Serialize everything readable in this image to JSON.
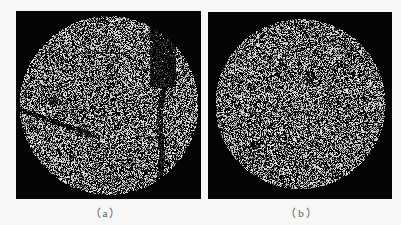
{
  "figure": {
    "background": "#f7f7f7",
    "panels": [
      {
        "id": "a",
        "caption": "（a）",
        "description": "Circular speckle/grain image on black background with dark cracks and voids on right and lower-left",
        "colors": {
          "background": "#050505",
          "speckle": "#d8d8d8"
        },
        "disc": {
          "cx": 0.5,
          "cy": 0.5,
          "r": 0.46
        },
        "cracks": true
      },
      {
        "id": "b",
        "caption": "（b）",
        "description": "Circular speckle/grain image on black background, mostly uniform with faint darker regions",
        "colors": {
          "background": "#050505",
          "speckle": "#d8d8d8"
        },
        "disc": {
          "cx": 0.5,
          "cy": 0.49,
          "r": 0.44
        },
        "cracks": false
      }
    ]
  }
}
